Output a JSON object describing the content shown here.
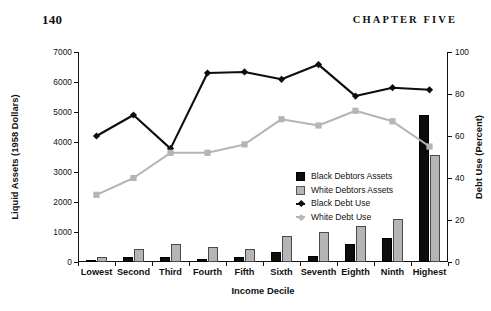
{
  "page": {
    "folio": "140",
    "running_head": "CHAPTER FIVE"
  },
  "chart_data": {
    "type": "bar",
    "title": "",
    "xlabel": "Income Decile",
    "ylabel": "Liquid Assets (1958 Dollars)",
    "y2label": "Debt Use (Percent)",
    "ylim": [
      0,
      7000
    ],
    "y2lim": [
      0,
      100
    ],
    "yticks": [
      "0",
      "1000",
      "2000",
      "3000",
      "4000",
      "5000",
      "6000",
      "7000"
    ],
    "ytick_values": [
      0,
      1000,
      2000,
      3000,
      4000,
      5000,
      6000,
      7000
    ],
    "y2ticks": [
      "0",
      "20",
      "40",
      "60",
      "80",
      "100"
    ],
    "y2tick_values": [
      0,
      20,
      40,
      60,
      80,
      100
    ],
    "grid": false,
    "legend_position": "center",
    "categories": [
      "Lowest",
      "Second",
      "Third",
      "Fourth",
      "Fifth",
      "Sixth",
      "Seventh",
      "Eighth",
      "Ninth",
      "Highest"
    ],
    "series": [
      {
        "name": "Black Debtors Assets",
        "kind": "bar",
        "axis": "left",
        "color": "#0d0d0d",
        "values": [
          40,
          170,
          180,
          110,
          170,
          330,
          200,
          600,
          810,
          4910
        ]
      },
      {
        "name": "White Debtors Assets",
        "kind": "bar",
        "axis": "left",
        "color": "#b5b5b5",
        "values": [
          160,
          430,
          610,
          490,
          450,
          880,
          990,
          1210,
          1450,
          3560
        ]
      },
      {
        "name": "Black Debt Use",
        "kind": "line",
        "axis": "right",
        "color": "#0d0d0d",
        "values": [
          60,
          70,
          54,
          90,
          90.5,
          87,
          94,
          79,
          83,
          82
        ]
      },
      {
        "name": "White Debt Use",
        "kind": "line",
        "axis": "right",
        "color": "#b5b5b5",
        "values": [
          32,
          40,
          52,
          52,
          56,
          68,
          65,
          72,
          67,
          55
        ]
      }
    ]
  },
  "legend": {
    "items": [
      {
        "label": "Black Debtors Assets",
        "marker": "square-black"
      },
      {
        "label": "White Debtors Assets",
        "marker": "square-gray"
      },
      {
        "label": "Black Debt Use",
        "marker": "line-diamond-black"
      },
      {
        "label": "White Debt Use",
        "marker": "line-square-gray"
      }
    ]
  }
}
